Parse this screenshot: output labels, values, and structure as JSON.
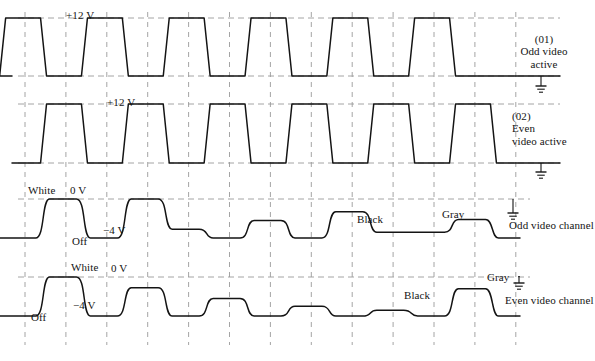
{
  "figure": {
    "type": "timing-waveform-diagram",
    "background_color": "#ffffff",
    "trace_color": "#141414",
    "grid_color": "#9a9a9a",
    "grid": {
      "vertical_dashed": true,
      "horizontal_dashed": true,
      "x_start": 25,
      "x_end": 516,
      "x_spacing": 40.9,
      "tick_count": 13
    }
  },
  "traces": [
    {
      "id": "trace-01",
      "name": "odd-video-active",
      "style": "square",
      "level_label": "+12 V",
      "level_label_x": 66,
      "level_label_y": 10,
      "right_label_lines": [
        "(01)",
        "Odd video",
        "active"
      ],
      "baseline_volts": 0,
      "high_volts": 12,
      "phase": "odd",
      "pattern": [
        1,
        0,
        1,
        0,
        1,
        0,
        1,
        0,
        1,
        0,
        1,
        0
      ],
      "ground_symbols": [
        {
          "x": 541,
          "y": 88
        }
      ]
    },
    {
      "id": "trace-02",
      "name": "even-video-active",
      "style": "square",
      "level_label": "+12 V",
      "level_label_x": 107,
      "level_label_y": 97,
      "right_label_lines": [
        "(02)",
        "Even",
        "video active"
      ],
      "baseline_volts": 0,
      "high_volts": 12,
      "phase": "even",
      "pattern": [
        0,
        1,
        0,
        1,
        0,
        1,
        0,
        1,
        0,
        1,
        0,
        1
      ],
      "ground_symbols": [
        {
          "x": 541,
          "y": 174
        }
      ]
    },
    {
      "id": "trace-03",
      "name": "odd-video-channel",
      "style": "rounded-video",
      "top_level_label": "0 V",
      "top_level_label_x": 70,
      "top_level_label_y": 185,
      "bottom_level_label": "−4 V",
      "bottom_level_label_x": 103,
      "bottom_level_label_y": 225,
      "right_label": "Odd video channel",
      "right_label_x": 509,
      "right_label_y": 220,
      "annotations": [
        {
          "text": "White",
          "x": 28,
          "y": 185
        },
        {
          "text": "Off",
          "x": 72,
          "y": 236
        },
        {
          "text": "Black",
          "x": 357,
          "y": 214
        },
        {
          "text": "Gray",
          "x": 442,
          "y": 209
        }
      ],
      "levels_volts": [
        -4,
        0,
        -4,
        0,
        -3.1,
        -4,
        -2.2,
        -4,
        -1.3,
        -3.4,
        -3.4,
        -2.1
      ],
      "ground_symbols": [
        {
          "x": 513,
          "y": 215
        }
      ]
    },
    {
      "id": "trace-04",
      "name": "even-video-channel",
      "style": "rounded-video",
      "top_level_label": "0 V",
      "top_level_label_x": 111,
      "top_level_label_y": 263,
      "bottom_level_label": "−4 V",
      "bottom_level_label_x": 73,
      "bottom_level_label_y": 300,
      "right_label": "Even video channel",
      "right_label_x": 505,
      "right_label_y": 295,
      "annotations": [
        {
          "text": "White",
          "x": 71,
          "y": 262
        },
        {
          "text": "Off",
          "x": 31,
          "y": 312
        },
        {
          "text": "Black",
          "x": 404,
          "y": 290
        },
        {
          "text": "Gray",
          "x": 487,
          "y": 272
        }
      ],
      "levels_volts": [
        -4,
        0,
        -4,
        -1.1,
        -4,
        -2.2,
        -4,
        -3.0,
        -4,
        -3.4,
        -4,
        -1.2
      ],
      "ground_symbols": [
        {
          "x": 519,
          "y": 285
        }
      ]
    }
  ],
  "voltage_labels": {
    "high": "+12 V",
    "zero": "0 V",
    "negative": "−4 V"
  },
  "signal_state_labels": {
    "white": "White",
    "off": "Off",
    "black": "Black",
    "gray": "Gray"
  }
}
